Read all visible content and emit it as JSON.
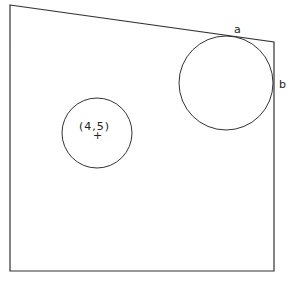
{
  "diagram": {
    "shape": {
      "type": "quadrilateral",
      "vertices": [
        [
          10,
          5
        ],
        [
          274,
          42
        ],
        [
          274,
          271
        ],
        [
          10,
          271
        ]
      ],
      "stroke": "#333333"
    },
    "large_circle": {
      "cx": 226,
      "cy": 83,
      "r": 47,
      "tangent_point_labels": {
        "a": "a",
        "b": "b"
      }
    },
    "small_circle": {
      "cx": 97,
      "cy": 133,
      "r": 35,
      "center_label": "(4,5)",
      "center_marker": "+"
    }
  }
}
